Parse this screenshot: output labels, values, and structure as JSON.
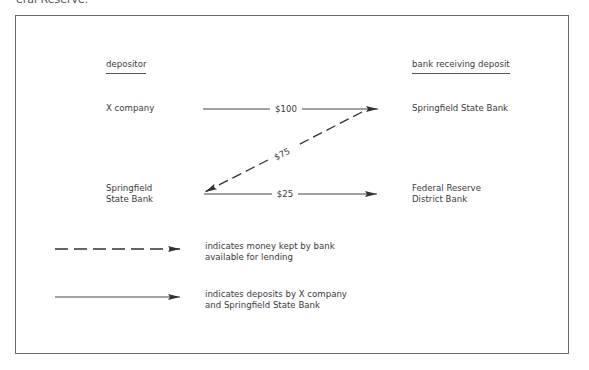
{
  "caption_fragment": "eral Reserve.",
  "headers": {
    "left": "depositor",
    "right": "bank receiving deposit"
  },
  "rows": [
    {
      "depositor": [
        "X company"
      ],
      "receiver": [
        "Springfield State Bank"
      ],
      "amount": "$100",
      "line_style": "solid"
    },
    {
      "depositor": [
        "Springfield",
        "State Bank"
      ],
      "receiver": [
        "Federal Reserve",
        "District Bank"
      ],
      "amount": "$25",
      "line_style": "solid"
    }
  ],
  "diagonal_flow": {
    "amount": "$75",
    "line_style": "dashed",
    "from": "Springfield State Bank (receiver)",
    "to": "Springfield State Bank (depositor)"
  },
  "legend": [
    {
      "line_style": "dashed",
      "lines": [
        "indicates money kept by bank",
        "available for lending"
      ]
    },
    {
      "line_style": "solid",
      "lines": [
        "indicates deposits by X company",
        "and Springfield State Bank"
      ]
    }
  ],
  "colors": {
    "line": "#333333",
    "frame": "#6a6a6a",
    "text": "#3a3a3a"
  }
}
